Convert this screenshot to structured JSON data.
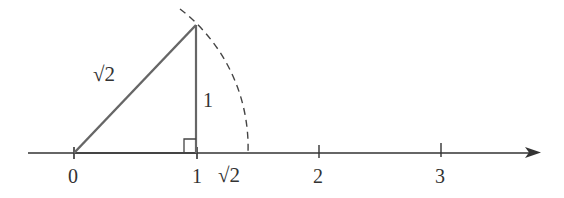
{
  "diagram": {
    "hypotenuse_label": "√2",
    "leg_label": "1",
    "axis_ticks": [
      {
        "label": "0",
        "value": 0
      },
      {
        "label": "1",
        "value": 1
      },
      {
        "label": "√2",
        "value": 1.414
      },
      {
        "label": "2",
        "value": 2
      },
      {
        "label": "3",
        "value": 3
      }
    ],
    "colors": {
      "stroke": "#555555",
      "axis": "#333333",
      "text": "#333333"
    }
  }
}
